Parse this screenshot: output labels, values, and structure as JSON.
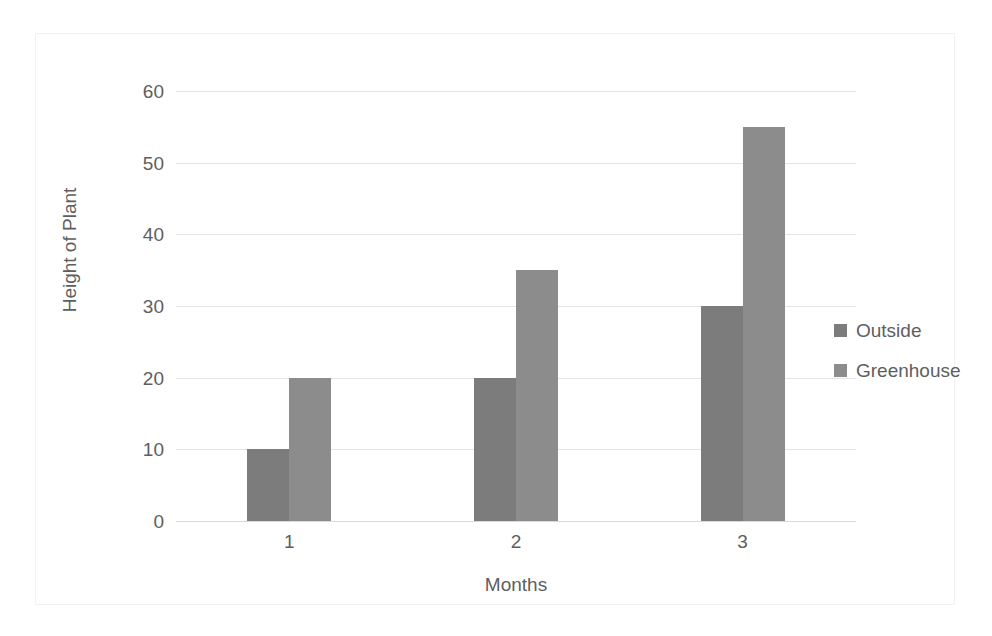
{
  "page": {
    "clipped_header_text": "",
    "background_color": "#ffffff",
    "frame_border_color": "#f2f2f2"
  },
  "chart_data": {
    "type": "bar",
    "title": "",
    "subtitle": "",
    "xlabel": "Months",
    "ylabel": "Height of Plant",
    "categories": [
      "1",
      "2",
      "3"
    ],
    "series": [
      {
        "name": "Outside",
        "values": [
          10,
          20,
          30
        ],
        "color": "#7c7c7c"
      },
      {
        "name": "Greenhouse",
        "values": [
          20,
          35,
          55
        ],
        "color": "#8c8c8c"
      }
    ],
    "ylim": [
      0,
      60
    ],
    "ytick_values": [
      0,
      10,
      20,
      30,
      40,
      50,
      60
    ],
    "ytick_labels": [
      "0",
      "10",
      "20",
      "30",
      "40",
      "50",
      "60"
    ],
    "grid": "horizontal",
    "legend_position": "right",
    "bar_style": "grouped",
    "gridline_color": "#e4e4e4",
    "text_color": "#5e5e5e"
  },
  "axes": {
    "y": {
      "title": "Height of Plant",
      "ticks": [
        {
          "label": "60",
          "value": 60
        },
        {
          "label": "50",
          "value": 50
        },
        {
          "label": "40",
          "value": 40
        },
        {
          "label": "30",
          "value": 30
        },
        {
          "label": "20",
          "value": 20
        },
        {
          "label": "10",
          "value": 10
        },
        {
          "label": "0",
          "value": 0
        }
      ]
    },
    "x": {
      "title": "Months",
      "ticks": [
        {
          "label": "1"
        },
        {
          "label": "2"
        },
        {
          "label": "3"
        }
      ]
    }
  },
  "legend": {
    "items": [
      {
        "label": "Outside",
        "color": "#7c7c7c"
      },
      {
        "label": "Greenhouse",
        "color": "#8c8c8c"
      }
    ]
  }
}
